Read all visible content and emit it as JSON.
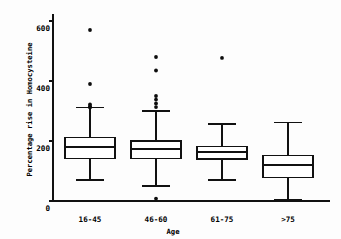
{
  "chart_data": {
    "type": "box",
    "title": "",
    "subtitle": "",
    "xlabel": "Age",
    "ylabel": "Percentage rise in Homocysteine",
    "categories": [
      "16-45",
      "46-60",
      "61-75",
      ">75"
    ],
    "ylim": [
      0,
      620
    ],
    "yticks": [
      0,
      200,
      400,
      600
    ],
    "ytick_labels": [
      "0",
      "200",
      "400",
      "600"
    ],
    "grid": false,
    "legend": null,
    "boxes": [
      {
        "category": "16-45",
        "whisker_low": 70,
        "q1": 143,
        "median": 180,
        "q3": 213,
        "whisker_high": 313,
        "outliers": [
          570,
          390,
          322,
          315,
          312
        ]
      },
      {
        "category": "46-60",
        "whisker_low": 50,
        "q1": 143,
        "median": 173,
        "q3": 200,
        "whisker_high": 300,
        "outliers": [
          480,
          435,
          350,
          338,
          325,
          313,
          8
        ]
      },
      {
        "category": "61-75",
        "whisker_low": 70,
        "q1": 140,
        "median": 163,
        "q3": 183,
        "whisker_high": 257,
        "outliers": [
          477
        ]
      },
      {
        "category": ">75",
        "whisker_low": 5,
        "q1": 77,
        "median": 120,
        "q3": 153,
        "whisker_high": 263,
        "outliers": []
      }
    ]
  },
  "axes": {
    "y_title": "Percentage rise in Homocysteine",
    "x_title": "Age",
    "y_tick_0": "0",
    "y_tick_200": "200",
    "y_tick_400": "400",
    "y_tick_600": "600",
    "x_cat_0": "16-45",
    "x_cat_1": "46-60",
    "x_cat_2": "61-75",
    "x_cat_3": ">75"
  },
  "colors": {
    "ink": "#111111",
    "background": "#fdfdfd",
    "box_fill": "#ffffff",
    "outlier": "#0d0d0d"
  }
}
